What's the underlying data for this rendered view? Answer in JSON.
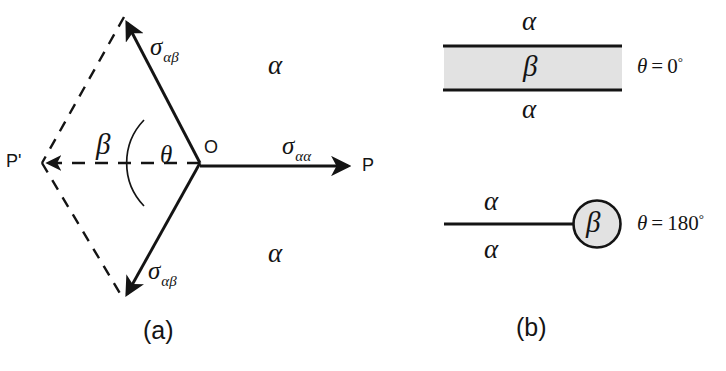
{
  "figure": {
    "width": 726,
    "height": 371,
    "background": "#ffffff",
    "ink_color": "#141414",
    "phase_fill_color": "#e2e2e2"
  },
  "panel_a": {
    "caption": "(a)",
    "vertex_label": "O",
    "left_point_label": "P'",
    "right_point_label": "P",
    "interfacial_tension_upper": {
      "symbol": "σ",
      "subscript": "αβ"
    },
    "interfacial_tension_lower": {
      "symbol": "σ",
      "subscript": "αβ"
    },
    "interfacial_tension_horizontal": {
      "symbol": "σ",
      "subscript": "αα"
    },
    "angle_label": "θ",
    "beta_phase_label": "β",
    "alpha_phase_upper_label": "α",
    "alpha_phase_lower_label": "α",
    "geometry": {
      "vertex_x": 200,
      "vertex_y": 163,
      "upper_tip_x": 124,
      "upper_tip_y": 17,
      "lower_tip_x": 124,
      "lower_tip_y": 300,
      "dashed_tip_x": 42,
      "dashed_tip_y": 163,
      "solid_right_tip_x": 356,
      "solid_right_tip_y": 163,
      "arc_radius": 62
    }
  },
  "panel_b": {
    "caption": "(b)",
    "case_zero": {
      "condition_symbol": "θ",
      "condition_equals": "=",
      "condition_value": "0",
      "condition_degree": "°",
      "slab_label": "β",
      "upper_phase_label": "α",
      "lower_phase_label": "α"
    },
    "case_onehundredeighty": {
      "condition_symbol": "θ",
      "condition_equals": "=",
      "condition_value": "180",
      "condition_degree": "°",
      "droplet_label": "β",
      "upper_phase_label": "α",
      "lower_phase_label": "α"
    }
  }
}
